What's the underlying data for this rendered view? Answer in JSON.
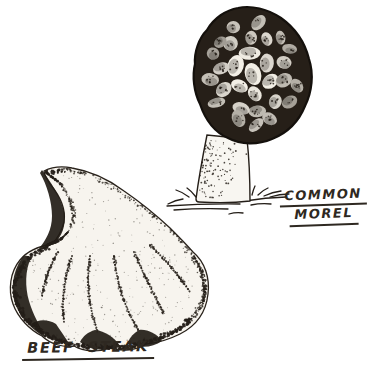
{
  "figure": {
    "background_color": "#ffffff",
    "ink_color": "#241e18",
    "flesh_color": "#f7f4ee",
    "specimens": [
      {
        "id": "common-morel",
        "label_line1": "COMMON",
        "label_line2": "MOREL"
      },
      {
        "id": "beefsteak",
        "label": "BEEF STEAK"
      }
    ]
  }
}
